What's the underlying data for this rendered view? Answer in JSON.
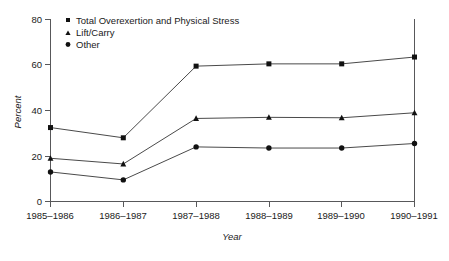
{
  "chart_data": {
    "type": "line",
    "title": "",
    "xlabel": "Year",
    "ylabel": "Percent",
    "categories": [
      "1985–1986",
      "1986–1987",
      "1987–1988",
      "1988–1989",
      "1989–1990",
      "1990–1991"
    ],
    "series": [
      {
        "name": "Total Overexertion and Physical Stress",
        "marker": "square",
        "values": [
          32.5,
          28.0,
          59.5,
          60.5,
          60.5,
          63.5
        ]
      },
      {
        "name": "Lift/Carry",
        "marker": "triangle",
        "values": [
          19.0,
          16.5,
          36.5,
          37.0,
          36.8,
          39.0
        ]
      },
      {
        "name": "Other",
        "marker": "circle",
        "values": [
          13.0,
          9.5,
          24.0,
          23.5,
          23.5,
          25.5
        ]
      }
    ],
    "ylim": [
      0,
      80
    ],
    "yticks": [
      0,
      20,
      40,
      60,
      80
    ],
    "ytick_labels": [
      "0",
      "20",
      "40",
      "60",
      "80"
    ],
    "grid": false,
    "legend_position": "top-left",
    "line_color": "#4a4a4a",
    "marker_color": "#111111",
    "axis_color": "#58585a",
    "background": "#ffffff"
  },
  "legend": {
    "items": [
      {
        "label": "Total Overexertion and Physical Stress",
        "marker": "square"
      },
      {
        "label": "Lift/Carry",
        "marker": "triangle"
      },
      {
        "label": "Other",
        "marker": "circle"
      }
    ]
  },
  "axes": {
    "y_title": "Percent",
    "x_title": "Year",
    "y_labels": [
      "80",
      "60",
      "40",
      "20",
      "0"
    ],
    "x_labels": [
      "1985–1986",
      "1986–1987",
      "1987–1988",
      "1988–1989",
      "1989–1990",
      "1990–1991"
    ]
  }
}
